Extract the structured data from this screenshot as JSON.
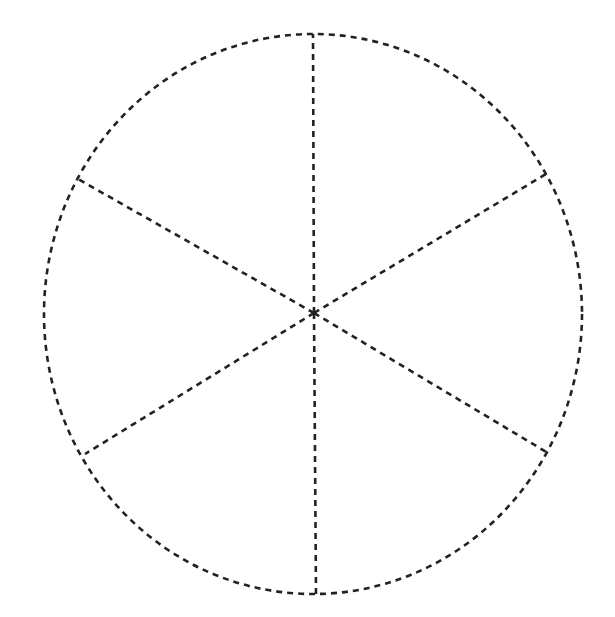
{
  "diagram": {
    "type": "sectored-ellipse",
    "stroke_color": "#222222",
    "background": "#ffffff",
    "stroke_width": 2.6,
    "dash_pattern": "6 5",
    "ellipse": {
      "cx": 313,
      "cy": 314,
      "rx": 269,
      "ry": 280
    },
    "center": {
      "x": 314,
      "y": 313
    },
    "sector_count": 6,
    "spokes": [
      {
        "name": "spoke-top",
        "x": 313,
        "y": 34
      },
      {
        "name": "spoke-upper-right",
        "x": 546,
        "y": 174
      },
      {
        "name": "spoke-lower-right",
        "x": 548,
        "y": 453
      },
      {
        "name": "spoke-bottom",
        "x": 316,
        "y": 594
      },
      {
        "name": "spoke-lower-left",
        "x": 85,
        "y": 454
      },
      {
        "name": "spoke-upper-left",
        "x": 78,
        "y": 179
      }
    ],
    "labels": []
  }
}
